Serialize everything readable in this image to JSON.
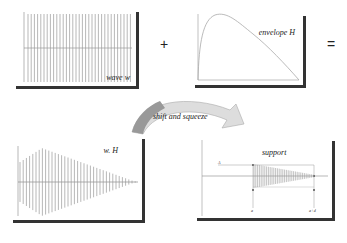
{
  "panels": {
    "wave": {
      "label": "wave w",
      "y_ticks": [
        "1",
        "0.5",
        "",
        "-0.5",
        "-1"
      ],
      "x_ticks": [
        "0.2",
        "0.4",
        "0.6",
        "0.8"
      ]
    },
    "envelope": {
      "label": "envelope H",
      "y_ticks": [
        "1",
        "0.8",
        "0.6",
        "0.4",
        "0.2"
      ],
      "x_ticks": [
        "0.2",
        "0.4",
        "0.6",
        "0.8",
        "1"
      ]
    },
    "product": {
      "label": "w. H",
      "y_ticks": [
        "1",
        "0.5",
        "",
        "-0.5",
        "-1"
      ],
      "x_ticks": [
        "0.2",
        "0.4",
        "0.6",
        "0.8"
      ]
    },
    "support": {
      "label": "support",
      "marker_left": "a",
      "marker_right": "a+d",
      "marker_top": "A"
    }
  },
  "operators": {
    "plus": "+",
    "equals": "="
  },
  "arrow": {
    "label": "shift and squeeze"
  }
}
